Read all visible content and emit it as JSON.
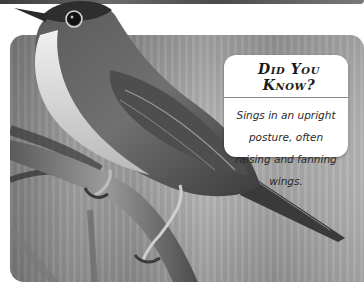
{
  "callout": {
    "title": "Did You Know?",
    "body": "Sings in an upright posture, often raising and fanning wings."
  },
  "image": {
    "subject": "songbird-perched-on-branch",
    "palette": "grayscale"
  }
}
